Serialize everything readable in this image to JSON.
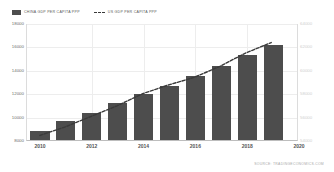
{
  "legend": {
    "entries": [
      {
        "label": "CHINA GDP PER CAPITA PPP",
        "marker": "bar-swatch",
        "color": "#4d4d4d"
      },
      {
        "label": "US GDP PER CAPITA PPP",
        "marker": "dashed-line-swatch",
        "color": "#3a3a3a"
      }
    ]
  },
  "source": {
    "text": "SOURCE: TRADINGECONOMICS.COM"
  },
  "chart_data": {
    "type": "bar",
    "title": "",
    "subtitle": "",
    "xlabel": "",
    "ylabel": "",
    "grid": true,
    "legend_position": "top-left",
    "x": [
      2010,
      2011,
      2012,
      2013,
      2014,
      2015,
      2016,
      2017,
      2018,
      2019
    ],
    "xlim": [
      2009.5,
      2020
    ],
    "xticks": [
      2010,
      2012,
      2014,
      2016,
      2018,
      2020
    ],
    "xtick_labels": [
      "2010",
      "2012",
      "2014",
      "2016",
      "2018",
      "2020"
    ],
    "left_axis": {
      "name": "CHINA GDP PER CAPITA PPP",
      "ylim": [
        8000,
        18000
      ],
      "yticks": [
        8000,
        10000,
        12000,
        14000,
        16000,
        18000
      ],
      "ytick_labels": [
        "8000",
        "10000",
        "12000",
        "14000",
        "16000",
        "18000"
      ]
    },
    "right_axis": {
      "name": "US GDP PER CAPITA PPP",
      "ylim": [
        54000,
        64000
      ],
      "yticks": [
        54000,
        56000,
        58000,
        60000,
        62000,
        64000
      ],
      "ytick_labels": [
        "54000",
        "56000",
        "58000",
        "60000",
        "62000",
        "64000"
      ]
    },
    "series": [
      {
        "name": "CHINA GDP PER CAPITA PPP",
        "type": "bar",
        "axis": "left",
        "color": "#4d4d4d",
        "values": [
          8800,
          9650,
          10350,
          11150,
          11950,
          12650,
          13450,
          14300,
          15250,
          16100
        ]
      },
      {
        "name": "US GDP PER CAPITA PPP",
        "type": "line",
        "axis": "right",
        "color": "#3a3a3a",
        "style": "dashed",
        "values": [
          54400,
          55150,
          56050,
          56950,
          58000,
          58750,
          59400,
          60350,
          61500,
          62400
        ]
      }
    ]
  }
}
